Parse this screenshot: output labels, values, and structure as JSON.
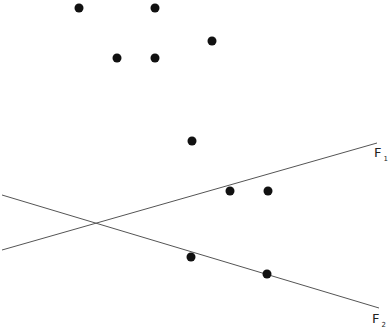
{
  "diagram": {
    "background": "#ffffff",
    "dot_color": "#111111",
    "line_color": "#555555",
    "dot_radius": 4.5,
    "points": [
      {
        "x": 79,
        "y": 8
      },
      {
        "x": 155,
        "y": 8
      },
      {
        "x": 212,
        "y": 41
      },
      {
        "x": 117,
        "y": 58
      },
      {
        "x": 155,
        "y": 58
      },
      {
        "x": 192,
        "y": 141
      },
      {
        "x": 230,
        "y": 191
      },
      {
        "x": 268,
        "y": 191
      },
      {
        "x": 191,
        "y": 257
      },
      {
        "x": 267,
        "y": 274
      }
    ],
    "lines": [
      {
        "name": "F1",
        "label_main": "F",
        "label_sub": "1",
        "x1": 2,
        "y1": 250,
        "x2": 377,
        "y2": 143,
        "label_x": 374,
        "label_y": 146
      },
      {
        "name": "F2",
        "label_main": "F",
        "label_sub": "2",
        "x1": 2,
        "y1": 195,
        "x2": 379,
        "y2": 308,
        "label_x": 372,
        "label_y": 312
      }
    ]
  }
}
